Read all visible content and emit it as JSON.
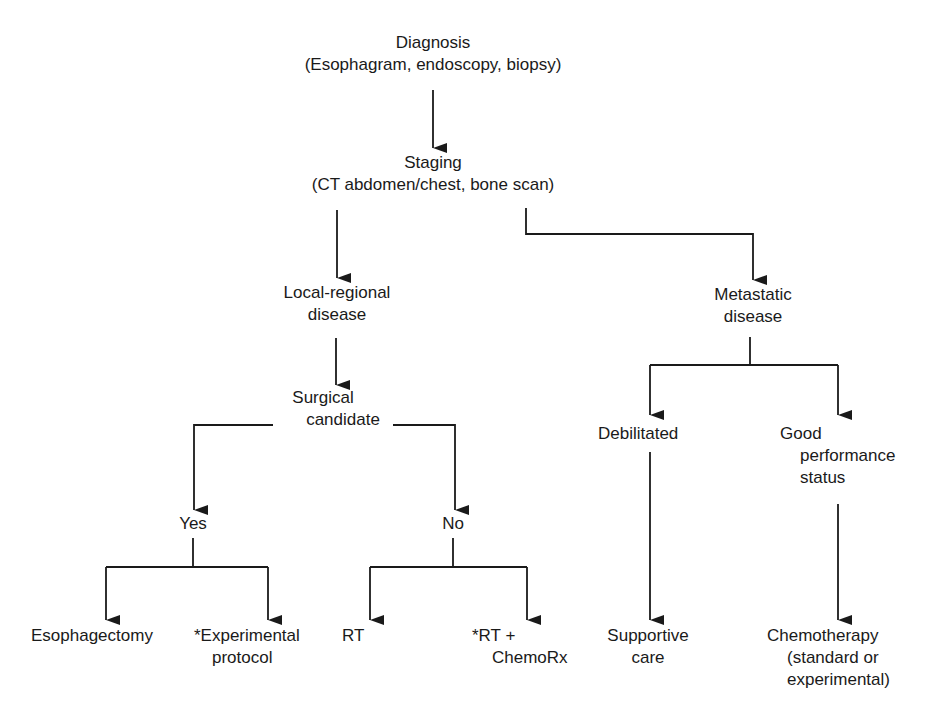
{
  "diagram": {
    "type": "flowchart",
    "nodes": {
      "diagnosis": {
        "line1": "Diagnosis",
        "line2": "(Esophagram, endoscopy, biopsy)"
      },
      "staging": {
        "line1": "Staging",
        "line2": "(CT abdomen/chest, bone scan)"
      },
      "local_regional": {
        "line1": "Local-regional",
        "line2": "disease"
      },
      "metastatic": {
        "line1": "Metastatic",
        "line2": "disease"
      },
      "surgical_candidate": {
        "line1": "Surgical",
        "line2": "candidate"
      },
      "yes": {
        "line1": "Yes"
      },
      "no": {
        "line1": "No"
      },
      "debilitated": {
        "line1": "Debilitated"
      },
      "good_performance": {
        "line1": "Good",
        "line2": "performance",
        "line3": "status"
      },
      "esophagectomy": {
        "line1": "Esophagectomy"
      },
      "experimental_protocol": {
        "line1": "*Experimental",
        "line2": "protocol"
      },
      "rt": {
        "line1": "RT"
      },
      "rt_chemo": {
        "line1": "*RT +",
        "line2": "ChemoRx"
      },
      "supportive_care": {
        "line1": "Supportive",
        "line2": "care"
      },
      "chemotherapy": {
        "line1": "Chemotherapy",
        "line2": "(standard or",
        "line3": "experimental)"
      }
    },
    "edges": [
      [
        "diagnosis",
        "staging"
      ],
      [
        "staging",
        "local_regional"
      ],
      [
        "staging",
        "metastatic"
      ],
      [
        "local_regional",
        "surgical_candidate"
      ],
      [
        "surgical_candidate",
        "yes"
      ],
      [
        "surgical_candidate",
        "no"
      ],
      [
        "yes",
        "esophagectomy"
      ],
      [
        "yes",
        "experimental_protocol"
      ],
      [
        "no",
        "rt"
      ],
      [
        "no",
        "rt_chemo"
      ],
      [
        "metastatic",
        "debilitated"
      ],
      [
        "metastatic",
        "good_performance"
      ],
      [
        "debilitated",
        "supportive_care"
      ],
      [
        "good_performance",
        "chemotherapy"
      ]
    ],
    "line_color": "#1a1a1a"
  }
}
